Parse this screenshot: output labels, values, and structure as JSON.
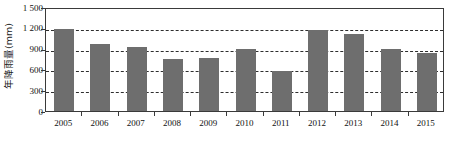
{
  "chart_data": {
    "type": "bar",
    "title": "",
    "subtitle": "",
    "xlabel": "",
    "ylabel": "年降雨量(mm)",
    "categories": [
      "2005",
      "2006",
      "2007",
      "2008",
      "2009",
      "2010",
      "2011",
      "2012",
      "2013",
      "2014",
      "2015"
    ],
    "values": [
      1185,
      960,
      930,
      750,
      770,
      895,
      570,
      1170,
      1110,
      895,
      835
    ],
    "series": [
      {
        "name": "年降雨量",
        "values": [
          1185,
          960,
          930,
          750,
          770,
          895,
          570,
          1170,
          1110,
          895,
          835
        ]
      }
    ],
    "ylim": [
      0,
      1500
    ],
    "xlim_categories": 11,
    "ytick_values": [
      0,
      300,
      600,
      900,
      1200,
      1500
    ],
    "ytick_labels": [
      "0",
      "300",
      "600",
      "900",
      "1 200",
      "1 500"
    ],
    "grid": "horizontal-dashed",
    "legend": "none",
    "bar_color": "#6e6e6e",
    "gridline_color": "#2e2e2e",
    "axis_color": "#3a3a3a",
    "background_color": "#ffffff",
    "text_color": "#111111"
  }
}
